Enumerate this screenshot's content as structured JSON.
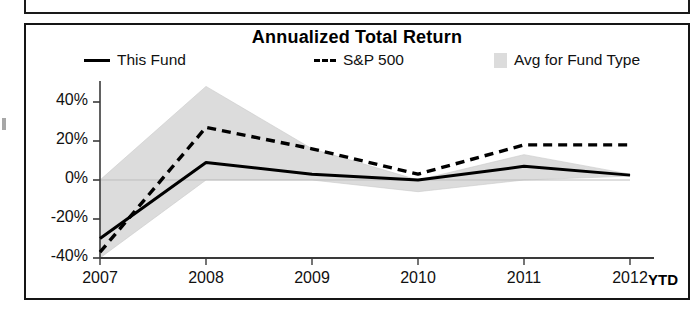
{
  "panel": {
    "title": "Annualized Total Return"
  },
  "legend": {
    "items": [
      {
        "label": "This Fund",
        "marker": "solid-line",
        "color": "#000000"
      },
      {
        "label": "S&P 500",
        "marker": "dashed-line",
        "color": "#000000"
      },
      {
        "label": "Avg for Fund Type",
        "marker": "gray-swatch",
        "color": "#dcdcdc"
      }
    ]
  },
  "axes": {
    "x_suffix_label": "YTD",
    "y_tick_labels": [
      "40%",
      "20%",
      "0%",
      "-20%",
      "-40%"
    ],
    "x_tick_labels": [
      "2007",
      "2008",
      "2009",
      "2010",
      "2011",
      "2012"
    ]
  },
  "chart_data": {
    "type": "line",
    "title": "Annualized Total Return",
    "xlabel": "",
    "ylabel": "",
    "x": [
      "2007",
      "2008",
      "2009",
      "2010",
      "2011",
      "2012"
    ],
    "categories": [
      "2007",
      "2008",
      "2009",
      "2010",
      "2011",
      "2012"
    ],
    "ylim": [
      -40,
      50
    ],
    "yticks": [
      -40,
      -20,
      0,
      20,
      40
    ],
    "ytick_labels": [
      "-40%",
      "-20%",
      "0%",
      "20%",
      "40%"
    ],
    "xtick_labels": [
      "2007",
      "2008",
      "2009",
      "2010",
      "2011",
      "2012"
    ],
    "grid": false,
    "legend_position": "top",
    "annotations": [
      "YTD"
    ],
    "series": [
      {
        "name": "This Fund",
        "style": "solid",
        "color": "#000000",
        "values": [
          -30,
          9,
          3,
          0,
          7,
          2.5
        ]
      },
      {
        "name": "S&P 500",
        "style": "dashed",
        "color": "#000000",
        "values": [
          -37,
          27,
          16,
          3,
          18,
          18
        ]
      },
      {
        "name": "Avg for Fund Type",
        "style": "band",
        "color": "#dcdcdc",
        "upper": [
          0,
          48,
          16,
          0,
          13,
          3
        ],
        "lower": [
          -40,
          0,
          0,
          -6,
          0,
          2
        ]
      }
    ]
  }
}
